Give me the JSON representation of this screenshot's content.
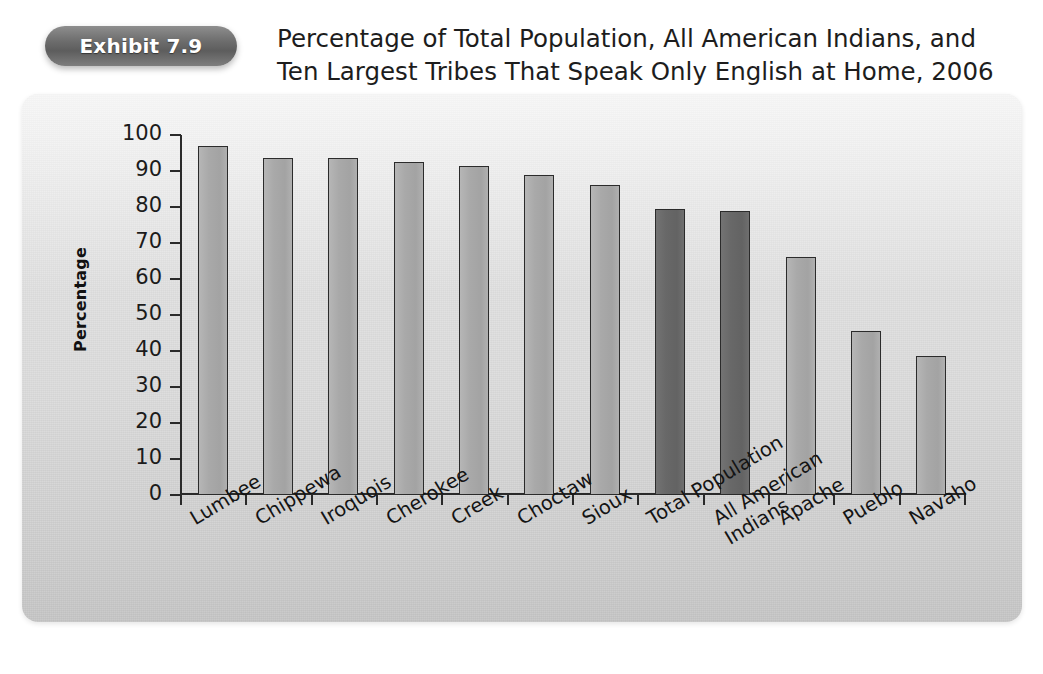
{
  "exhibit": {
    "badge_label": "Exhibit 7.9",
    "title_line1": "Percentage of Total Population, All American Indians, and",
    "title_line2": "Ten Largest Tribes That Speak Only English at Home, 2006"
  },
  "colors": {
    "panel_background": "#dcdcdc",
    "bar_light": "#a9a9a9",
    "bar_dark": "#686868",
    "axis": "#2a2a2a",
    "badge": "#6d6d6d",
    "text": "#1b1b1b"
  },
  "chart_data": {
    "type": "bar",
    "title": "Percentage of Total Population, All American Indians, and Ten Largest Tribes That Speak Only English at Home, 2006",
    "xlabel": "",
    "ylabel": "Percentage",
    "ylim": [
      0,
      100
    ],
    "ytick_labels": [
      "100",
      "90",
      "80",
      "70",
      "60",
      "50",
      "40",
      "30",
      "20",
      "10",
      "0"
    ],
    "yticks": [
      100,
      90,
      80,
      70,
      60,
      50,
      40,
      30,
      20,
      10,
      0
    ],
    "grid": false,
    "legend": false,
    "categories": [
      "Lumbee",
      "Chippewa",
      "Iroquois",
      "Cherokee",
      "Creek",
      "Choctaw",
      "Sioux",
      "Total Population",
      "All American Indians",
      "Apache",
      "Pueblo",
      "Navaho"
    ],
    "values": [
      97,
      93.5,
      93.5,
      92.5,
      91.5,
      89,
      86,
      79.5,
      79,
      66,
      45.5,
      38.5
    ],
    "bar_styles": [
      "light",
      "light",
      "light",
      "light",
      "light",
      "light",
      "light",
      "dark",
      "dark",
      "light",
      "light",
      "light"
    ],
    "category_label_lines": [
      [
        "Lumbee"
      ],
      [
        "Chippewa"
      ],
      [
        "Iroquois"
      ],
      [
        "Cherokee"
      ],
      [
        "Creek"
      ],
      [
        "Choctaw"
      ],
      [
        "Sioux"
      ],
      [
        "Total Population"
      ],
      [
        "All American",
        "Indians"
      ],
      [
        "Apache"
      ],
      [
        "Pueblo"
      ],
      [
        "Navaho"
      ]
    ]
  }
}
